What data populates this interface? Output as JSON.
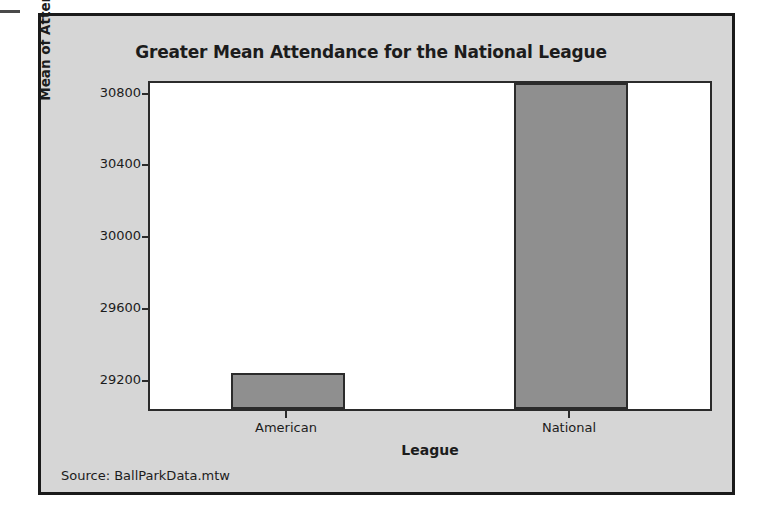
{
  "chart_data": {
    "type": "bar",
    "title": "Greater Mean Attendance for the National League",
    "xlabel": "League",
    "ylabel": "Mean of Attendance",
    "categories": [
      "American",
      "National"
    ],
    "values": [
      29230,
      30850
    ],
    "ylim": [
      29030,
      30870
    ],
    "yticks": [
      29200,
      29600,
      30000,
      30400,
      30800
    ],
    "ytick_labels": [
      "29200",
      "29600",
      "30000",
      "30400",
      "30800"
    ],
    "grid": false,
    "legend": "none",
    "bar_fill_color": "#8f8f8f",
    "bar_border_color": "#2b2b2b",
    "plot_background_color": "#ffffff",
    "panel_background_color": "#d6d6d6",
    "text_color": "#1c1c1c"
  },
  "footer": {
    "source_note": "Source: BallParkData.mtw"
  }
}
